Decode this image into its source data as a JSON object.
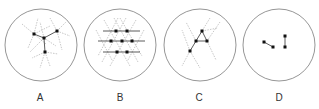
{
  "panels": [
    {
      "label": "A",
      "center": [
        41,
        45
      ],
      "radius": 36,
      "dots": [
        [
          34,
          34
        ],
        [
          44,
          38
        ],
        [
          57,
          31
        ],
        [
          45,
          52
        ]
      ],
      "solid_lines": [
        [
          [
            34,
            34
          ],
          [
            44,
            38
          ]
        ],
        [
          [
            44,
            38
          ],
          [
            57,
            31
          ]
        ],
        [
          [
            44,
            38
          ],
          [
            45,
            52
          ]
        ]
      ],
      "dashed_lines": [
        [
          [
            22,
            24
          ],
          [
            46,
            44
          ]
        ],
        [
          [
            34,
            34
          ],
          [
            28,
            48
          ]
        ],
        [
          [
            34,
            34
          ],
          [
            38,
            18
          ]
        ],
        [
          [
            34,
            34
          ],
          [
            50,
            26
          ]
        ],
        [
          [
            44,
            38
          ],
          [
            30,
            52
          ]
        ],
        [
          [
            44,
            38
          ],
          [
            56,
            46
          ]
        ],
        [
          [
            44,
            38
          ],
          [
            40,
            22
          ]
        ],
        [
          [
            57,
            31
          ],
          [
            66,
            22
          ]
        ],
        [
          [
            57,
            31
          ],
          [
            70,
            36
          ]
        ],
        [
          [
            57,
            31
          ],
          [
            50,
            18
          ]
        ],
        [
          [
            57,
            31
          ],
          [
            62,
            50
          ]
        ],
        [
          [
            45,
            52
          ],
          [
            32,
            58
          ]
        ],
        [
          [
            45,
            52
          ],
          [
            58,
            54
          ]
        ],
        [
          [
            45,
            52
          ],
          [
            40,
            68
          ]
        ],
        [
          [
            45,
            52
          ],
          [
            50,
            66
          ]
        ]
      ]
    },
    {
      "label": "B",
      "center": [
        120,
        45
      ],
      "radius": 36,
      "dots": [
        [
          116,
          31
        ],
        [
          127,
          31
        ],
        [
          111,
          41
        ],
        [
          122,
          41
        ],
        [
          132,
          41
        ],
        [
          117,
          52
        ],
        [
          127,
          52
        ]
      ],
      "solid_lines": [
        [
          [
            103,
            31
          ],
          [
            140,
            31
          ]
        ],
        [
          [
            98,
            41
          ],
          [
            145,
            41
          ]
        ],
        [
          [
            103,
            52
          ],
          [
            140,
            52
          ]
        ]
      ],
      "dashed_lines": [
        [
          [
            104,
            20
          ],
          [
            130,
            66
          ]
        ],
        [
          [
            114,
            18
          ],
          [
            138,
            62
          ]
        ],
        [
          [
            96,
            30
          ],
          [
            112,
            60
          ]
        ],
        [
          [
            120,
            18
          ],
          [
            142,
            56
          ]
        ],
        [
          [
            136,
            20
          ],
          [
            110,
            66
          ]
        ],
        [
          [
            126,
            18
          ],
          [
            102,
            62
          ]
        ],
        [
          [
            144,
            30
          ],
          [
            128,
            60
          ]
        ],
        [
          [
            118,
            18
          ],
          [
            98,
            56
          ]
        ]
      ]
    },
    {
      "label": "C",
      "center": [
        200,
        45
      ],
      "radius": 36,
      "dots": [
        [
          202,
          31
        ],
        [
          196,
          41
        ],
        [
          207,
          41
        ],
        [
          190,
          51
        ]
      ],
      "solid_lines": [
        [
          [
            202,
            31
          ],
          [
            196,
            41
          ]
        ],
        [
          [
            202,
            31
          ],
          [
            207,
            41
          ]
        ],
        [
          [
            196,
            41
          ],
          [
            207,
            41
          ]
        ],
        [
          [
            196,
            41
          ],
          [
            190,
            51
          ]
        ]
      ],
      "dashed_lines": [
        [
          [
            210,
            18
          ],
          [
            202,
            31
          ]
        ],
        [
          [
            202,
            31
          ],
          [
            218,
            28
          ]
        ],
        [
          [
            207,
            41
          ],
          [
            216,
            60
          ]
        ],
        [
          [
            207,
            41
          ],
          [
            220,
            22
          ]
        ],
        [
          [
            190,
            51
          ],
          [
            182,
            66
          ]
        ],
        [
          [
            190,
            51
          ],
          [
            200,
            68
          ]
        ],
        [
          [
            190,
            51
          ],
          [
            182,
            30
          ]
        ],
        [
          [
            196,
            41
          ],
          [
            186,
            22
          ]
        ]
      ]
    },
    {
      "label": "D",
      "center": [
        279,
        45
      ],
      "radius": 36,
      "dots": [
        [
          264,
          42
        ],
        [
          273,
          47
        ],
        [
          285,
          36
        ],
        [
          285,
          47
        ]
      ],
      "solid_lines": [
        [
          [
            264,
            42
          ],
          [
            273,
            47
          ]
        ],
        [
          [
            285,
            36
          ],
          [
            285,
            47
          ]
        ]
      ],
      "dashed_lines": []
    }
  ],
  "colors": {
    "circle": "#8a8a8a",
    "dot": "#111111",
    "solid": "#333333",
    "dashed": "#b0b0b0",
    "label": "#333333"
  }
}
